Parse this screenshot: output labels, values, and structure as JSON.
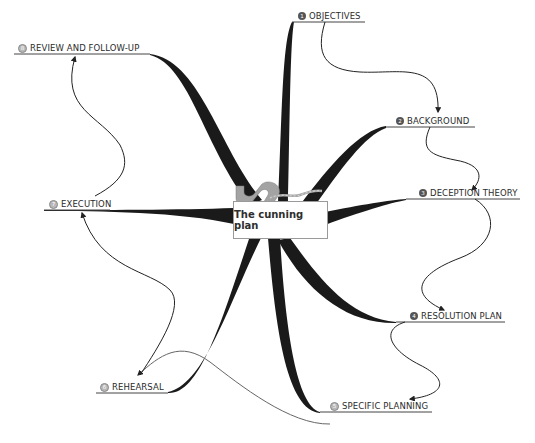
{
  "diagram": {
    "type": "mind-map",
    "central_topic": "The cunning plan",
    "central_icon": "winding-road-icon",
    "colors": {
      "branch": "#1a1a1a",
      "line": "#333333",
      "underline": "#444444",
      "text": "#2b2b2b",
      "icon_gray": "#a0a0a0",
      "badge_dark": "#555555",
      "badge_light": "#b8b8b8"
    },
    "nodes": [
      {
        "id": 1,
        "number": "1",
        "label": "OBJECTIVES",
        "badge_style": "dark"
      },
      {
        "id": 2,
        "number": "2",
        "label": "BACKGROUND",
        "badge_style": "dark"
      },
      {
        "id": 3,
        "number": "3",
        "label": "DECEPTION THEORY",
        "badge_style": "dark"
      },
      {
        "id": 4,
        "number": "4",
        "label": "RESOLUTION PLAN",
        "badge_style": "dark"
      },
      {
        "id": 5,
        "number": "5",
        "label": "SPECIFIC PLANNING",
        "badge_style": "light"
      },
      {
        "id": 6,
        "number": "6",
        "label": "REHEARSAL",
        "badge_style": "light"
      },
      {
        "id": 7,
        "number": "7",
        "label": "EXECUTION",
        "badge_style": "light"
      },
      {
        "id": 8,
        "number": "8",
        "label": "REVIEW AND FOLLOW-UP",
        "badge_style": "light"
      }
    ],
    "sequence_arrows": [
      {
        "from": "OBJECTIVES",
        "to": "BACKGROUND"
      },
      {
        "from": "BACKGROUND",
        "to": "DECEPTION THEORY"
      },
      {
        "from": "DECEPTION THEORY",
        "to": "RESOLUTION PLAN"
      },
      {
        "from": "RESOLUTION PLAN",
        "to": "SPECIFIC PLANNING"
      },
      {
        "from": "SPECIFIC PLANNING",
        "to": "REHEARSAL"
      },
      {
        "from": "REHEARSAL",
        "to": "EXECUTION"
      },
      {
        "from": "EXECUTION",
        "to": "REVIEW AND FOLLOW-UP"
      }
    ]
  }
}
